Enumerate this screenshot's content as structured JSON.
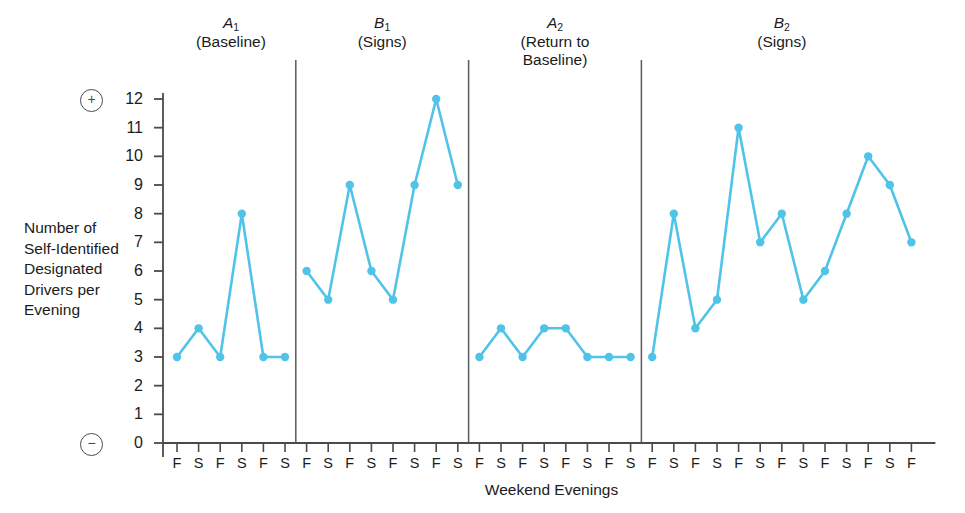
{
  "chart_data": {
    "type": "line",
    "title": "",
    "xlabel": "Weekend Evenings",
    "ylabel": "Number of Self-Identified Designated Drivers per Evening",
    "ylabel_lines": [
      "Number of",
      "Self-Identified",
      "Designated",
      "Drivers per",
      "Evening"
    ],
    "ylim": [
      0,
      12
    ],
    "yticks": [
      0,
      1,
      2,
      3,
      4,
      5,
      6,
      7,
      8,
      9,
      10,
      11,
      12
    ],
    "y_axis_top_symbol": "+",
    "y_axis_bottom_symbol": "−",
    "grid": false,
    "legend": "none",
    "line_color": "#4FC3E8",
    "marker_color": "#4FC3E8",
    "axis_color": "#4a4a4a",
    "divider_color": "#5a5a5a",
    "x_tick_labels": [
      "F",
      "S",
      "F",
      "S",
      "F",
      "S",
      "F",
      "S",
      "F",
      "S",
      "F",
      "S",
      "F",
      "S",
      "F",
      "S",
      "F",
      "S",
      "F",
      "S",
      "F",
      "S",
      "F",
      "S",
      "F",
      "S",
      "F",
      "S",
      "F",
      "S",
      "F",
      "S",
      "F",
      "S",
      "F"
    ],
    "phases": [
      {
        "id": "A1",
        "name": "A",
        "subscript": "1",
        "condition": "(Baseline)",
        "x_labels": [
          "F",
          "S",
          "F",
          "S",
          "F",
          "S"
        ],
        "values": [
          3,
          4,
          3,
          8,
          3,
          3
        ]
      },
      {
        "id": "B1",
        "name": "B",
        "subscript": "1",
        "condition": "(Signs)",
        "x_labels": [
          "F",
          "S",
          "F",
          "S",
          "F",
          "S",
          "F",
          "S"
        ],
        "values": [
          6,
          5,
          9,
          6,
          5,
          9,
          12,
          9
        ]
      },
      {
        "id": "A2",
        "name": "A",
        "subscript": "2",
        "condition": "(Return to Baseline)",
        "condition_lines": [
          "(Return to",
          "Baseline)"
        ],
        "x_labels": [
          "F",
          "S",
          "F",
          "S",
          "F",
          "S",
          "F",
          "S"
        ],
        "values": [
          3,
          4,
          3,
          4,
          4,
          3,
          3,
          3
        ]
      },
      {
        "id": "B2",
        "name": "B",
        "subscript": "2",
        "condition": "(Signs)",
        "x_labels": [
          "F",
          "S",
          "F",
          "S",
          "F",
          "S",
          "F",
          "S",
          "F",
          "S",
          "F",
          "S",
          "F"
        ],
        "values": [
          3,
          8,
          4,
          5,
          11,
          7,
          8,
          5,
          6,
          8,
          10,
          9,
          7
        ]
      }
    ]
  }
}
